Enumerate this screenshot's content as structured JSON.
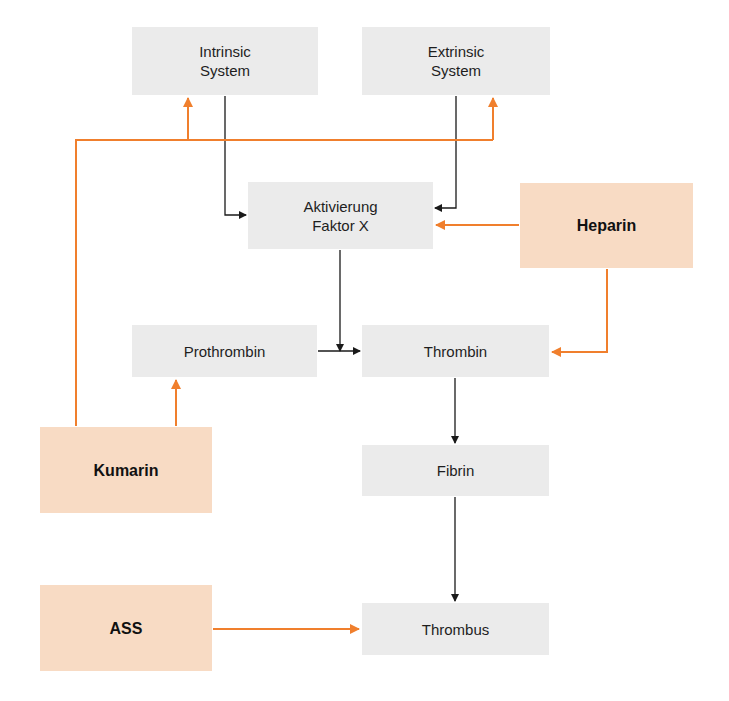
{
  "colors": {
    "process_box": "#ebebeb",
    "drug_box": "#f8dbc4",
    "process_arrow": "#1a1a1a",
    "drug_arrow": "#f07f2d"
  },
  "nodes": {
    "intrinsic": "Intrinsic\nSystem",
    "extrinsic": "Extrinsic\nSystem",
    "faktor_x": "Aktivierung\nFaktor X",
    "heparin": "Heparin",
    "prothrombin": "Prothrombin",
    "thrombin": "Thrombin",
    "kumarin": "Kumarin",
    "fibrin": "Fibrin",
    "ass": "ASS",
    "thrombus": "Thrombus"
  },
  "edges": [
    {
      "from": "intrinsic",
      "to": "faktor_x",
      "type": "process"
    },
    {
      "from": "extrinsic",
      "to": "faktor_x",
      "type": "process"
    },
    {
      "from": "faktor_x",
      "to": "thrombin",
      "type": "process"
    },
    {
      "from": "prothrombin",
      "to": "thrombin",
      "type": "process"
    },
    {
      "from": "thrombin",
      "to": "fibrin",
      "type": "process"
    },
    {
      "from": "fibrin",
      "to": "thrombus",
      "type": "process"
    },
    {
      "from": "heparin",
      "to": "faktor_x",
      "type": "inhibitor"
    },
    {
      "from": "heparin",
      "to": "thrombin",
      "type": "inhibitor"
    },
    {
      "from": "kumarin",
      "to": "prothrombin",
      "type": "inhibitor"
    },
    {
      "from": "kumarin",
      "to": "intrinsic",
      "type": "inhibitor"
    },
    {
      "from": "kumarin",
      "to": "extrinsic",
      "type": "inhibitor"
    },
    {
      "from": "ass",
      "to": "thrombus",
      "type": "inhibitor"
    }
  ]
}
